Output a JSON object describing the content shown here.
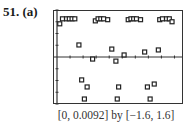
{
  "problem": {
    "number_label": "51.",
    "part_label": "(a)"
  },
  "caption": "[0, 0.0092] by [−1.6, 1.6]",
  "chart_data": {
    "type": "scatter",
    "title": "",
    "xlabel": "",
    "ylabel": "",
    "xlim": [
      0,
      0.0092
    ],
    "ylim": [
      -1.6,
      1.6
    ],
    "grid": false,
    "legend": null,
    "window_caption": "[0, 0.0092] by [-1.6, 1.6]",
    "x_ticks_count": 9,
    "y_ticks_count": 8,
    "marker": "square",
    "series": [
      {
        "name": "sampled points",
        "points": [
          [
            0.0002,
            1.13
          ],
          [
            0.0004,
            1.3
          ],
          [
            0.0007,
            1.3
          ],
          [
            0.0009,
            1.3
          ],
          [
            0.0011,
            1.3
          ],
          [
            0.0013,
            1.3
          ],
          [
            0.0028,
            1.23
          ],
          [
            0.003,
            1.3
          ],
          [
            0.0032,
            1.3
          ],
          [
            0.0034,
            1.3
          ],
          [
            0.0037,
            1.27
          ],
          [
            0.0052,
            1.27
          ],
          [
            0.0054,
            1.3
          ],
          [
            0.0056,
            1.3
          ],
          [
            0.0058,
            1.3
          ],
          [
            0.0061,
            1.27
          ],
          [
            0.0075,
            1.27
          ],
          [
            0.0077,
            1.3
          ],
          [
            0.008,
            1.3
          ],
          [
            0.0082,
            1.3
          ],
          [
            0.0084,
            1.2
          ],
          [
            0.0016,
            0.41
          ],
          [
            0.004,
            0.27
          ],
          [
            0.0026,
            -0.07
          ],
          [
            0.0043,
            -0.14
          ],
          [
            0.0049,
            0.07
          ],
          [
            0.0064,
            0.17
          ],
          [
            0.0074,
            0.24
          ],
          [
            0.0018,
            -0.78
          ],
          [
            0.0022,
            -1.02
          ],
          [
            0.002,
            -1.43
          ],
          [
            0.0045,
            -1.02
          ],
          [
            0.0044,
            -1.43
          ],
          [
            0.0066,
            -1.02
          ],
          [
            0.0071,
            -0.92
          ],
          [
            0.0068,
            -1.43
          ]
        ]
      }
    ]
  },
  "colors": {
    "axis": "#333333",
    "marker": "#222222",
    "background": "#ffffff"
  }
}
